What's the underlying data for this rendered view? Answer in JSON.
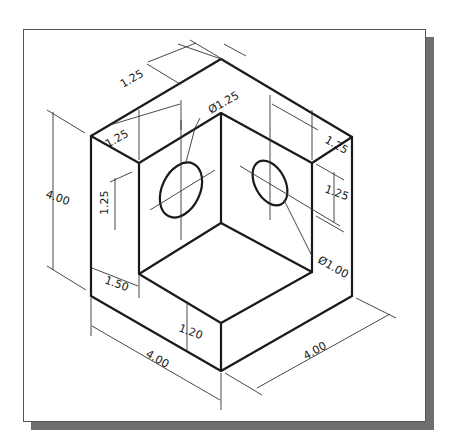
{
  "drawing": {
    "type": "isometric-technical-drawing",
    "colors": {
      "background": "#ffffff",
      "frame_border": "#555555",
      "frame_shadow": "#6e6e6e",
      "object_lines": "#1a1a1a",
      "dimension_lines": "#333333"
    },
    "dimensions": {
      "top_back_width": "1.25",
      "top_left_wall_thickness": "1.25",
      "top_right_wall_thickness": "1.25",
      "hole_left_diameter": "Ø1.25",
      "hole_right_diameter": "Ø1.00",
      "overall_height": "4.00",
      "left_hole_vertical_offset": "1.25",
      "right_hole_vertical_offset": "1.25",
      "base_step_width": "1.50",
      "base_height": "1.20",
      "front_left_length": "4.00",
      "front_right_length": "4.00"
    }
  }
}
